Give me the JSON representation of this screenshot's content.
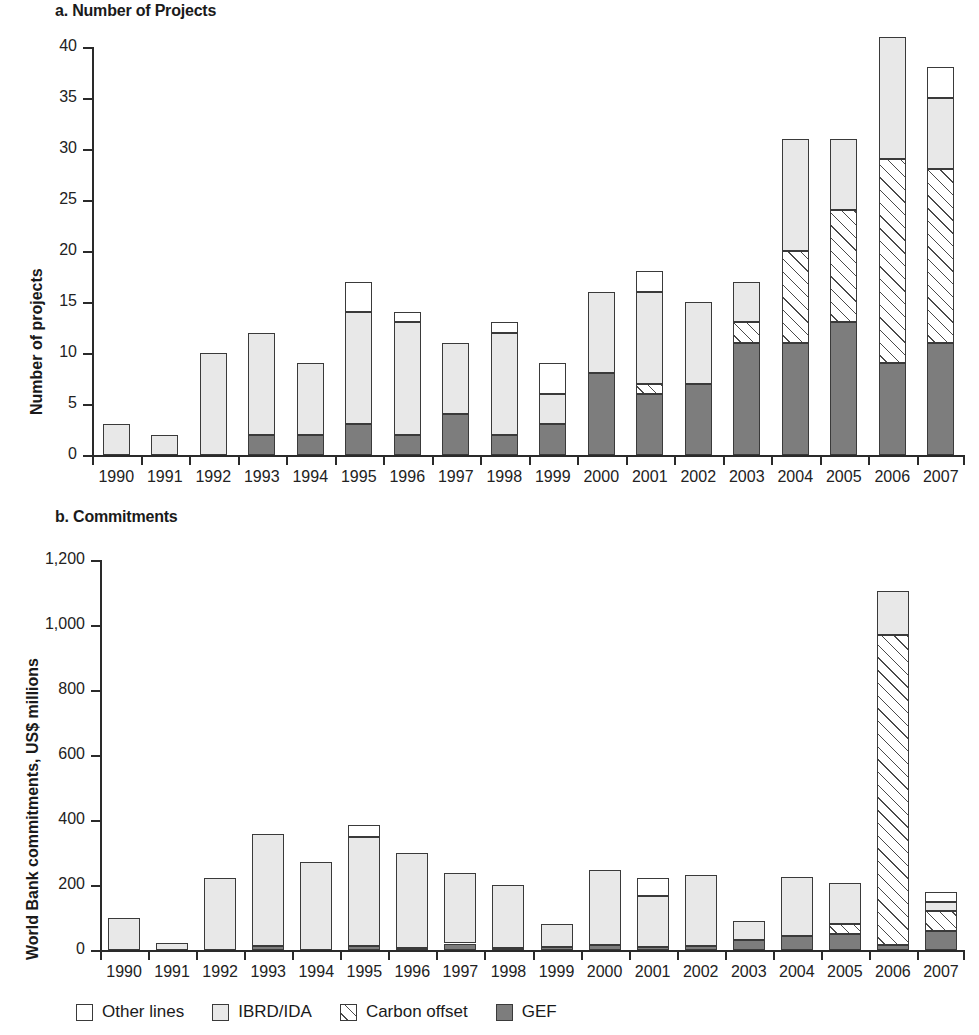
{
  "panel_a": {
    "title": "a. Number of Projects",
    "ylabel": "Number of projects"
  },
  "panel_b": {
    "title": "b. Commitments",
    "ylabel": "World Bank commitments, US$ millions"
  },
  "legend": {
    "items": [
      {
        "label": "Other lines",
        "key": "other",
        "color": "#ffffff"
      },
      {
        "label": "IBRD/IDA",
        "key": "ibrd",
        "color": "#e8e8e8"
      },
      {
        "label": "Carbon offset",
        "key": "carbon",
        "color": "#ffffff"
      },
      {
        "label": "GEF",
        "key": "gef",
        "color": "#7d7d7d"
      }
    ]
  },
  "chart_data": [
    {
      "id": "a",
      "type": "bar",
      "stacked": true,
      "title": "a. Number of Projects",
      "xlabel": "",
      "ylabel": "Number of projects",
      "ylim": [
        0,
        40
      ],
      "yticks": [
        0,
        5,
        10,
        15,
        20,
        25,
        30,
        35,
        40
      ],
      "ytick_labels": [
        "0",
        "5",
        "10",
        "15",
        "20",
        "25",
        "30",
        "35",
        "40"
      ],
      "grid": false,
      "legend_position": "bottom",
      "categories": [
        "1990",
        "1991",
        "1992",
        "1993",
        "1994",
        "1995",
        "1996",
        "1997",
        "1998",
        "1999",
        "2000",
        "2001",
        "2002",
        "2003",
        "2004",
        "2005",
        "2006",
        "2007"
      ],
      "series": [
        {
          "name": "GEF",
          "key": "gef",
          "values": [
            0,
            0,
            0,
            2,
            2,
            3,
            2,
            4,
            2,
            3,
            8,
            6,
            7,
            11,
            11,
            13,
            9,
            11
          ]
        },
        {
          "name": "Carbon offset",
          "key": "carbon",
          "values": [
            0,
            0,
            0,
            0,
            0,
            0,
            0,
            0,
            0,
            0,
            0,
            1,
            0,
            2,
            9,
            11,
            20,
            17
          ]
        },
        {
          "name": "IBRD/IDA",
          "key": "ibrd",
          "values": [
            3,
            2,
            10,
            10,
            7,
            11,
            11,
            7,
            10,
            3,
            8,
            9,
            8,
            4,
            11,
            7,
            12,
            7
          ]
        },
        {
          "name": "Other lines",
          "key": "other",
          "values": [
            0,
            0,
            0,
            0,
            0,
            3,
            1,
            0,
            1,
            3,
            0,
            2,
            0,
            0,
            0,
            0,
            0,
            3
          ]
        }
      ],
      "totals": [
        3,
        2,
        10,
        12,
        9,
        17,
        14,
        11,
        13,
        9,
        16,
        18,
        15,
        17,
        31,
        31,
        41,
        38
      ]
    },
    {
      "id": "b",
      "type": "bar",
      "stacked": true,
      "title": "b. Commitments",
      "xlabel": "",
      "ylabel": "World Bank commitments, US$ millions",
      "ylim": [
        0,
        1200
      ],
      "yticks": [
        0,
        200,
        400,
        600,
        800,
        1000,
        1200
      ],
      "ytick_labels": [
        "0",
        "200",
        "400",
        "600",
        "800",
        "1,000",
        "1,200"
      ],
      "grid": false,
      "legend_position": "bottom",
      "categories": [
        "1990",
        "1991",
        "1992",
        "1993",
        "1994",
        "1995",
        "1996",
        "1997",
        "1998",
        "1999",
        "2000",
        "2001",
        "2002",
        "2003",
        "2004",
        "2005",
        "2006",
        "2007"
      ],
      "series": [
        {
          "name": "GEF",
          "key": "gef",
          "values": [
            0,
            0,
            0,
            12,
            0,
            12,
            5,
            20,
            6,
            8,
            16,
            8,
            12,
            30,
            43,
            50,
            14,
            58
          ]
        },
        {
          "name": "Carbon offset",
          "key": "carbon",
          "values": [
            0,
            0,
            0,
            0,
            0,
            0,
            0,
            0,
            0,
            0,
            0,
            0,
            0,
            0,
            0,
            30,
            955,
            62
          ]
        },
        {
          "name": "IBRD/IDA",
          "key": "ibrd",
          "values": [
            100,
            22,
            223,
            345,
            270,
            335,
            294,
            216,
            195,
            73,
            231,
            157,
            219,
            58,
            182,
            125,
            135,
            28
          ]
        },
        {
          "name": "Other lines",
          "key": "other",
          "values": [
            0,
            0,
            0,
            0,
            0,
            38,
            0,
            0,
            0,
            0,
            0,
            57,
            0,
            0,
            0,
            0,
            0,
            30
          ]
        }
      ],
      "totals": [
        100,
        22,
        223,
        357,
        270,
        385,
        299,
        236,
        201,
        81,
        247,
        222,
        231,
        88,
        225,
        205,
        1104,
        178
      ]
    }
  ]
}
